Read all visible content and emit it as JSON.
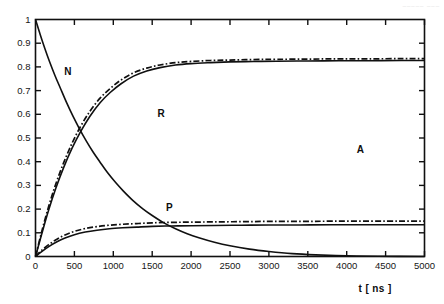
{
  "scan_header": "_____  ___",
  "chart_data": {
    "type": "line",
    "title": "",
    "subtitle": "",
    "xlabel": "t [ ns ]",
    "ylabel": "",
    "xlim": [
      0,
      5000
    ],
    "ylim": [
      0,
      1
    ],
    "grid": false,
    "legend_position": "inline-annotations",
    "x_ticks": [
      0,
      500,
      1000,
      1500,
      2000,
      2500,
      3000,
      3500,
      4000,
      4500,
      5000
    ],
    "x_tick_labels": [
      "0",
      "500",
      "1000",
      "1500",
      "2000",
      "2500",
      "3000",
      "3500",
      "4000",
      "4500",
      "5000"
    ],
    "y_ticks": [
      0,
      0.1,
      0.2,
      0.3,
      0.4,
      0.5,
      0.6,
      0.7,
      0.8,
      0.9,
      1
    ],
    "y_tick_labels": [
      "0",
      "0.1",
      "0.2",
      "0.3",
      "0.4",
      "0.5",
      "0.6",
      "0.7",
      "0.8",
      "0.9",
      "1"
    ],
    "annotations": [
      {
        "text": "N",
        "x": 420,
        "y": 0.78
      },
      {
        "text": "R",
        "x": 1620,
        "y": 0.6
      },
      {
        "text": "P",
        "x": 1730,
        "y": 0.205
      },
      {
        "text": "A",
        "x": 4180,
        "y": 0.45
      }
    ],
    "series": [
      {
        "name": "N",
        "style": "solid",
        "color": "#101010",
        "x": [
          0,
          60,
          120,
          180,
          250,
          320,
          400,
          480,
          560,
          650,
          740,
          830,
          930,
          1030,
          1130,
          1250,
          1380,
          1500,
          1650,
          1800,
          1950,
          2100,
          2300,
          2500,
          2750,
          3000,
          3300,
          3600,
          4000,
          4400,
          5000
        ],
        "y": [
          1.0,
          0.937,
          0.878,
          0.823,
          0.764,
          0.71,
          0.649,
          0.593,
          0.542,
          0.489,
          0.441,
          0.398,
          0.352,
          0.312,
          0.276,
          0.237,
          0.201,
          0.173,
          0.142,
          0.117,
          0.096,
          0.079,
          0.06,
          0.045,
          0.031,
          0.021,
          0.012,
          0.007,
          0.003,
          0.001,
          0.0
        ]
      },
      {
        "name": "R-solid",
        "style": "solid",
        "color": "#101010",
        "x": [
          0,
          80,
          170,
          260,
          360,
          470,
          580,
          700,
          830,
          960,
          1100,
          1260,
          1430,
          1600,
          1800,
          2000,
          2250,
          2500,
          2800,
          3100,
          3500,
          3900,
          4300,
          4700,
          5000
        ],
        "y": [
          0.0,
          0.095,
          0.197,
          0.287,
          0.374,
          0.457,
          0.527,
          0.592,
          0.649,
          0.692,
          0.729,
          0.761,
          0.783,
          0.797,
          0.808,
          0.814,
          0.818,
          0.821,
          0.823,
          0.824,
          0.825,
          0.826,
          0.826,
          0.827,
          0.827
        ]
      },
      {
        "name": "R-dashdot",
        "style": "dash-dot",
        "color": "#101010",
        "x": [
          0,
          80,
          170,
          260,
          360,
          470,
          580,
          700,
          830,
          960,
          1100,
          1260,
          1430,
          1600,
          1800,
          2000,
          2250,
          2500,
          2800,
          3100,
          3500,
          3900,
          4300,
          4700,
          5000
        ],
        "y": [
          0.0,
          0.105,
          0.212,
          0.305,
          0.394,
          0.478,
          0.549,
          0.613,
          0.668,
          0.709,
          0.745,
          0.775,
          0.795,
          0.808,
          0.818,
          0.823,
          0.827,
          0.829,
          0.831,
          0.832,
          0.833,
          0.834,
          0.834,
          0.835,
          0.835
        ]
      },
      {
        "name": "P-solid",
        "style": "solid",
        "color": "#101010",
        "x": [
          0,
          80,
          170,
          270,
          380,
          500,
          640,
          790,
          950,
          1120,
          1300,
          1500,
          1750,
          2000,
          2300,
          2650,
          3000,
          3400,
          3800,
          4300,
          4700,
          5000
        ],
        "y": [
          0.0,
          0.021,
          0.042,
          0.061,
          0.078,
          0.092,
          0.103,
          0.111,
          0.117,
          0.121,
          0.124,
          0.127,
          0.129,
          0.13,
          0.131,
          0.132,
          0.133,
          0.133,
          0.134,
          0.134,
          0.134,
          0.134
        ]
      },
      {
        "name": "P-dashdot",
        "style": "dash-dot",
        "color": "#101010",
        "x": [
          0,
          80,
          170,
          270,
          380,
          500,
          640,
          790,
          950,
          1120,
          1300,
          1500,
          1750,
          2000,
          2300,
          2650,
          3000,
          3400,
          3800,
          4300,
          4700,
          5000
        ],
        "y": [
          0.0,
          0.026,
          0.05,
          0.072,
          0.091,
          0.106,
          0.118,
          0.126,
          0.132,
          0.136,
          0.139,
          0.142,
          0.144,
          0.145,
          0.146,
          0.147,
          0.148,
          0.148,
          0.149,
          0.149,
          0.149,
          0.149
        ]
      }
    ]
  }
}
